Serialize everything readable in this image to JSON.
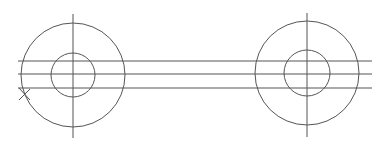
{
  "drawing": {
    "stroke_color": "#555555",
    "background": "#ffffff",
    "left_hub": {
      "cx": 73,
      "cy": 75,
      "outer_r": 52,
      "inner_r": 22,
      "axis_top": 14,
      "axis_bottom": 138
    },
    "right_hub": {
      "cx": 307,
      "cy": 73,
      "outer_r": 52,
      "inner_r": 23,
      "axis_top": 13,
      "axis_bottom": 137
    },
    "rails": {
      "x_start": 18,
      "x_end": 372,
      "y": [
        61,
        74,
        88
      ]
    },
    "marker": {
      "type": "x-mark",
      "x": 24,
      "y": 95
    }
  }
}
